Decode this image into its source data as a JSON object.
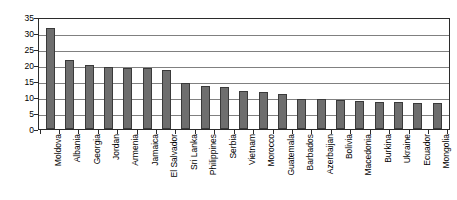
{
  "chart_data": {
    "type": "bar",
    "title": "",
    "xlabel": "",
    "ylabel": "",
    "ylim": [
      0,
      35
    ],
    "yticks": [
      0,
      5,
      10,
      15,
      20,
      25,
      30,
      35
    ],
    "grid": true,
    "legend": "none",
    "bar_color": "#6e6e6e",
    "bar_border_color": "#3a3a3a",
    "categories": [
      "Moldova",
      "Albania",
      "Georgia",
      "Jordan",
      "Armenia",
      "Jamaica",
      "El Salvador",
      "Sri Lanka",
      "Philippines",
      "Serbia",
      "Vietnam",
      "Morocco",
      "Guatemala",
      "Barbados",
      "Azerbaijan",
      "Bolivia",
      "Macedonia",
      "Burkina",
      "Ukraine",
      "Ecuador",
      "Mongolia"
    ],
    "values": [
      31.5,
      21.5,
      20.0,
      19.5,
      19.0,
      19.0,
      18.5,
      14.5,
      13.5,
      13.0,
      12.0,
      11.5,
      11.0,
      9.5,
      9.3,
      9.0,
      8.8,
      8.5,
      8.3,
      8.2,
      8.0
    ]
  }
}
